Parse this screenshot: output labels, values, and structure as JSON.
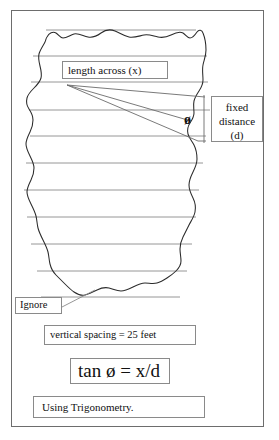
{
  "diagram": {
    "title_text": "",
    "labels": {
      "length_across": "length across (x)",
      "fixed_distance": "fixed\ndistance\n(d)",
      "fixed_distance_line1": "fixed",
      "fixed_distance_line2": "distance",
      "fixed_distance_line3": "(d)",
      "ignore": "Ignore",
      "vertical_spacing": "vertical spacing  = 25 feet",
      "formula": "tan ø = x/d",
      "using_trigonometry": "Using Trigonometry.",
      "angle_symbol": "ø"
    },
    "colors": {
      "frame_border": "#6d6d6d",
      "box_border": "#8a8a8a",
      "outline_stroke": "#2b2b2b",
      "transect_stroke": "#7d7d7d",
      "angle_line_stroke": "#6b6b6b",
      "leader_stroke": "#8a8a8a",
      "background": "#ffffff",
      "text": "#111111"
    },
    "geometry": {
      "frame": {
        "x": 11,
        "y": 10,
        "w": 253,
        "h": 417
      },
      "transect_line_ys": [
        30,
        56,
        82,
        110,
        136,
        163,
        190,
        217,
        244,
        271,
        297
      ],
      "vertical_spacing_feet": 25,
      "angle_vertex": {
        "x": 190,
        "y": 122
      },
      "fixed_distance_bracket_x": 204
    }
  }
}
